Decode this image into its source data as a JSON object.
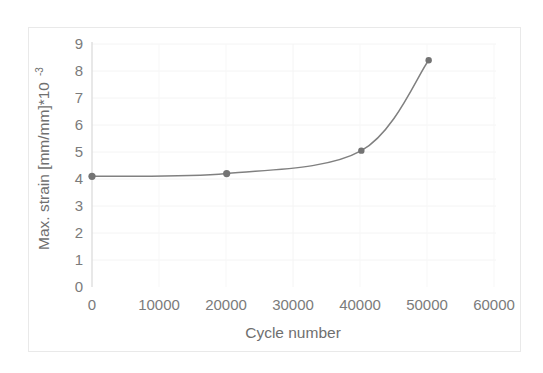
{
  "chart_data": {
    "type": "line",
    "title": "",
    "subtitle": "",
    "xlabel": "Cycle number",
    "ylabel": "Max. strain [mm/mm]*10",
    "ylabel_exponent": "-3",
    "x": [
      0,
      20000,
      40000,
      50000
    ],
    "values": [
      4.1,
      4.2,
      5.05,
      8.4
    ],
    "series": [
      {
        "name": "Max. strain",
        "x": [
          0,
          20000,
          40000,
          50000
        ],
        "values": [
          4.1,
          4.2,
          5.05,
          8.4
        ]
      }
    ],
    "xlim": [
      0,
      60000
    ],
    "ylim": [
      0,
      9
    ],
    "xticks": [
      0,
      10000,
      20000,
      30000,
      40000,
      50000,
      60000
    ],
    "xtick_labels": [
      "0",
      "10000",
      "20000",
      "30000",
      "40000",
      "50000",
      "60000"
    ],
    "yticks": [
      0,
      1,
      2,
      3,
      4,
      5,
      6,
      7,
      8,
      9
    ],
    "ytick_labels": [
      "0",
      "1",
      "2",
      "3",
      "4",
      "5",
      "6",
      "7",
      "8",
      "9"
    ],
    "grid": true,
    "grid_axis": "y",
    "legend": false,
    "legend_position": "none",
    "line_color": "#808080",
    "marker_color": "#737373",
    "marker_shape": "circle",
    "grid_color": "#f2f2f2",
    "axis_color": "#d6d6d6",
    "frame_color": "#e9e9e9",
    "text_color": "#7b7b7b",
    "annotations": []
  }
}
